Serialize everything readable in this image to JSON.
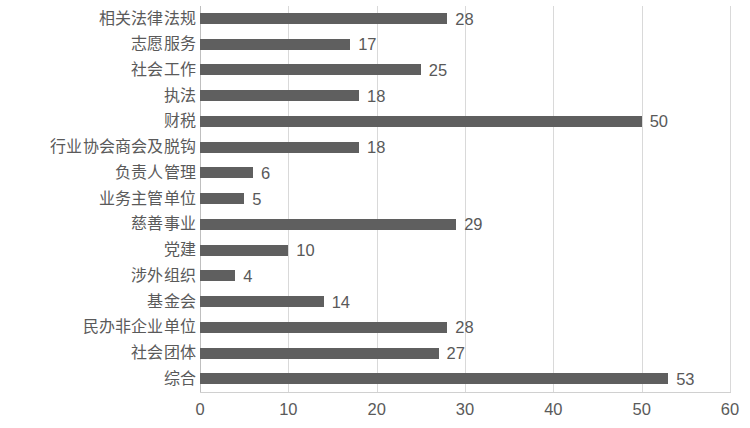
{
  "chart_data": {
    "type": "bar",
    "orientation": "horizontal",
    "title": "",
    "subtitle": "",
    "xlabel": "",
    "ylabel": "",
    "xlim": [
      0,
      60
    ],
    "xticks": [
      "0",
      "10",
      "20",
      "30",
      "40",
      "50",
      "60"
    ],
    "grid": "vertical",
    "legend": "none",
    "bar_color": "#5f5f5f",
    "gridline_color": "#d9d9d9",
    "text_color": "#5a5a5a",
    "categories": [
      "相关法律法规",
      "志愿服务",
      "社会工作",
      "执法",
      "财税",
      "行业协会商会及脱钩",
      "负责人管理",
      "业务主管单位",
      "慈善事业",
      "党建",
      "涉外组织",
      "基金会",
      "民办非企业单位",
      "社会团体",
      "综合"
    ],
    "values": [
      28,
      17,
      25,
      18,
      50,
      18,
      6,
      5,
      29,
      10,
      4,
      14,
      28,
      27,
      53
    ],
    "data_labels": [
      "28",
      "17",
      "25",
      "18",
      "50",
      "18",
      "6",
      "5",
      "29",
      "10",
      "4",
      "14",
      "28",
      "27",
      "53"
    ]
  }
}
